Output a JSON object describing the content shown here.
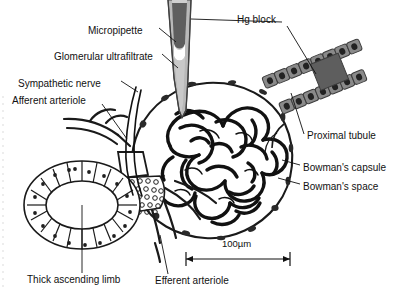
{
  "figure": {
    "background_color": "#ffffff",
    "ink_color": "#111111"
  },
  "labels": [
    {
      "id": "micropipette",
      "text": "Micropipette",
      "x": 88,
      "y": 31,
      "align": "left"
    },
    {
      "id": "ultrafiltrate",
      "text": "Glomerular ultrafiltrate",
      "x": 54,
      "y": 57,
      "align": "left"
    },
    {
      "id": "sympathetic",
      "text": "Sympathetic nerve",
      "x": 18,
      "y": 84,
      "align": "left"
    },
    {
      "id": "afferent",
      "text": "Afferent arteriole",
      "x": 12,
      "y": 101,
      "align": "left"
    },
    {
      "id": "hg-block",
      "text": "Hg block",
      "x": 237,
      "y": 20,
      "align": "left"
    },
    {
      "id": "proximal",
      "text": "Proximal tubule",
      "x": 307,
      "y": 136,
      "align": "left"
    },
    {
      "id": "bowmans-capsule",
      "text": "Bowman's capsule",
      "x": 303,
      "y": 168,
      "align": "left"
    },
    {
      "id": "bowmans-space",
      "text": "Bowman's space",
      "x": 303,
      "y": 187,
      "align": "left"
    },
    {
      "id": "thick-limb",
      "text": "Thick ascending limb",
      "x": 27,
      "y": 280,
      "align": "left"
    },
    {
      "id": "efferent",
      "text": "Efferent arteriole",
      "x": 155,
      "y": 281,
      "align": "left"
    }
  ],
  "scale_bar": {
    "label": "100µm",
    "label_x": 222,
    "label_y": 243,
    "x_start": 186,
    "x_end": 290,
    "y": 259
  },
  "structures": {
    "micropipette": {
      "name": "micropipette",
      "glass_color": "#b9b9b9",
      "mercury_color": "#5e5e5e",
      "meniscus_color": "#ffffff"
    },
    "proximal_tubule": {
      "name": "proximal tubule",
      "cell_color": "#8a8a8a",
      "nucleus_color": "#2b2b2b",
      "hg_block_color": "#5e5e5e"
    },
    "bowmans_capsule": {
      "name": "Bowman's capsule",
      "stroke": "#1a1a1a"
    },
    "glomerulus": {
      "name": "glomerular capillary tuft",
      "stroke": "#111111"
    },
    "thick_ascending_limb": {
      "name": "thick ascending limb",
      "cell_fill": "#ffffff",
      "stroke": "#1a1a1a"
    },
    "macula_densa": {
      "name": "macula densa / juxtaglomerular cells",
      "stroke": "#1a1a1a"
    }
  }
}
